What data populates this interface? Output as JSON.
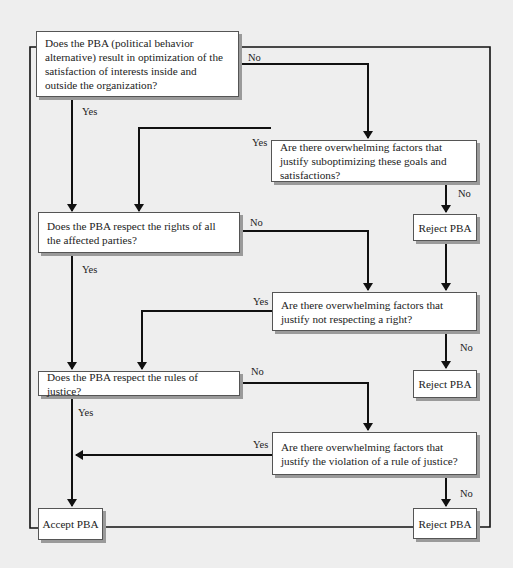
{
  "diagram": {
    "type": "flowchart",
    "colors": {
      "background": "#eeeeee",
      "box": "#ffffff",
      "line": "#111111",
      "shadow": "#9a9a9a"
    },
    "nodes": {
      "q1": "Does the PBA (political behavior alternative) result in optimization of the satisfaction of interests inside and outside the organization?",
      "q1_override": "Are there overwhelming factors that justify suboptimizing these goals and satisfactions?",
      "reject1": "Reject PBA",
      "q2": "Does the PBA respect the rights of all the affected parties?",
      "q2_override": "Are there overwhelming factors that justify not respecting a right?",
      "reject2": "Reject PBA",
      "q3": "Does the PBA respect the rules of justice?",
      "q3_override": "Are there overwhelming factors that justify the violation of a rule of justice?",
      "reject3": "Reject PBA",
      "accept": "Accept PBA"
    },
    "edge_labels": {
      "q1_no": "No",
      "q1_yes": "Yes",
      "q1o_yes": "Yes",
      "q1o_no": "No",
      "q2_no": "No",
      "q2_yes": "Yes",
      "q2o_yes": "Yes",
      "q2o_no": "No",
      "q3_no": "No",
      "q3_yes": "Yes",
      "q3o_yes": "Yes",
      "q3o_no": "No"
    },
    "edges": [
      {
        "from": "q1",
        "to": "q1_override",
        "label": "No"
      },
      {
        "from": "q1",
        "to": "q2",
        "label": "Yes"
      },
      {
        "from": "q1_override",
        "to": "q2",
        "label": "Yes"
      },
      {
        "from": "q1_override",
        "to": "reject1",
        "label": "No"
      },
      {
        "from": "q2",
        "to": "q2_override",
        "label": "No"
      },
      {
        "from": "q2",
        "to": "q3",
        "label": "Yes"
      },
      {
        "from": "q2_override",
        "to": "q3",
        "label": "Yes"
      },
      {
        "from": "q2_override",
        "to": "reject2",
        "label": "No"
      },
      {
        "from": "q3",
        "to": "q3_override",
        "label": "No"
      },
      {
        "from": "q3",
        "to": "accept",
        "label": "Yes"
      },
      {
        "from": "q3_override",
        "to": "accept",
        "label": "Yes"
      },
      {
        "from": "q3_override",
        "to": "reject3",
        "label": "No"
      }
    ]
  }
}
